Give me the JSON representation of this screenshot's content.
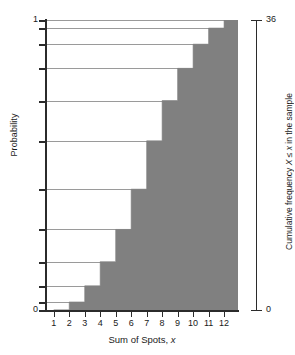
{
  "chart_data": {
    "type": "area",
    "title": "",
    "subtitle": "",
    "xlabel_parts": {
      "text": "Sum of Spots, ",
      "italic": "x"
    },
    "xlabel": "Sum of Spots, x",
    "ylabel": "Probability",
    "ylabel_right_parts": {
      "line1_a": "Cumulative frequency ",
      "line1_x1": "X",
      "line1_b": " ≤ ",
      "line1_x2": "x",
      "line1_c": " in the sample",
      "line2_a": "space ",
      "line2_omega": "Ω",
      "line2_b": " for pairs of dice thrown"
    },
    "ylabel_right": "Cumulative frequency X ≤ x in the sample space Ω for pairs of dice thrown",
    "categories": [
      1,
      2,
      3,
      4,
      5,
      6,
      7,
      8,
      9,
      10,
      11,
      12
    ],
    "x": [
      1,
      2,
      3,
      4,
      5,
      6,
      7,
      8,
      9,
      10,
      11,
      12
    ],
    "values": [
      0,
      0.0278,
      0.0833,
      0.1667,
      0.2778,
      0.4167,
      0.5833,
      0.7222,
      0.8333,
      0.9167,
      0.9722,
      1
    ],
    "cumulative_frequency": [
      0,
      1,
      3,
      6,
      10,
      15,
      21,
      26,
      30,
      33,
      35,
      36
    ],
    "frequency": [
      0,
      1,
      2,
      3,
      4,
      5,
      6,
      5,
      4,
      3,
      2,
      1
    ],
    "denominator": 36,
    "xlim": [
      0.5,
      12.9
    ],
    "ylim": [
      0,
      1
    ],
    "ylim_right": [
      0,
      36
    ],
    "ytick_labels": [
      "0",
      "1"
    ],
    "ytick_values": [
      0,
      1
    ],
    "ytick_right_labels": [
      "0",
      "36"
    ],
    "ytick_right_values": [
      0,
      36
    ],
    "xtick_labels": [
      "1",
      "2",
      "3",
      "4",
      "5",
      "6",
      "7",
      "8",
      "9",
      "10",
      "11",
      "12"
    ],
    "gridlines": true,
    "gridline_values": [
      0.0278,
      0.0833,
      0.1667,
      0.2778,
      0.4167,
      0.5833,
      0.7222,
      0.8333,
      0.9167,
      0.9722,
      1
    ],
    "legend": "none",
    "fill_color": "#808080",
    "grid_color": "#9a9a9a",
    "axis_color": "#2b2b2b",
    "background_color": "#ffffff"
  }
}
